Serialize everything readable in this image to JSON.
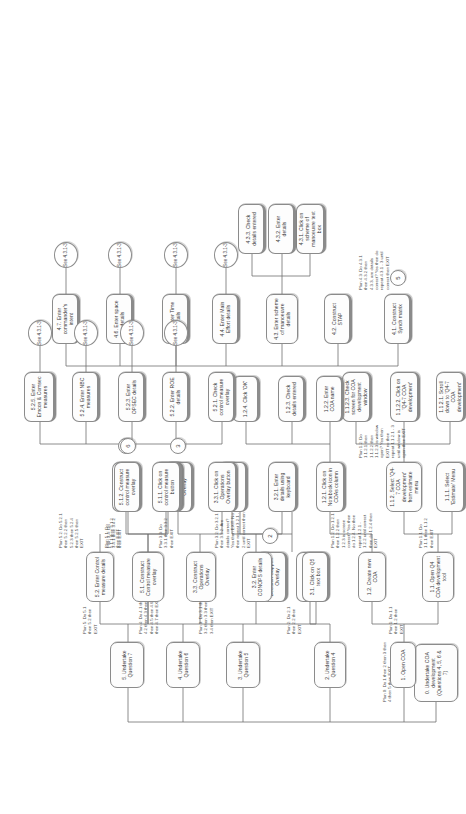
{
  "diagram": {
    "type": "hierarchical-task-analysis",
    "orientation": "rotated-90-ccw",
    "accent": "#8b8b8b",
    "background": "#ffffff"
  },
  "nodes": [
    {
      "id": "n0",
      "label": "0. Undertake COA development (Questions 4, 5, 6 & 7)"
    },
    {
      "id": "n1",
      "label": "1. Open COA"
    },
    {
      "id": "n11",
      "label": "1.1. Open Q4 COA development tool"
    },
    {
      "id": "n111",
      "label": "1.1.1. Select 'Estimate' Menu"
    },
    {
      "id": "n112",
      "label": "1.1.2. Select 'Q4-7 COA development' from estimate menu"
    },
    {
      "id": "n1121",
      "label": "1.1.2.1. Scroll down to 'Q4-7 COA development'"
    },
    {
      "id": "n1122",
      "label": "1.1.2.2. Click on 'Q4-7 COA development'"
    },
    {
      "id": "n1123",
      "label": "1.1.2.3. Check screen for COA development window"
    },
    {
      "id": "n12",
      "label": "1.2. Create new COA"
    },
    {
      "id": "n121",
      "label": "1.2.1. Click on Notebook icon in COAs column"
    },
    {
      "id": "n122",
      "label": "1.2.2. Enter COA name"
    },
    {
      "id": "n123",
      "label": "1.2.3. Check details entered"
    },
    {
      "id": "n124",
      "label": "1.2.4. Click 'OK'"
    },
    {
      "id": "n2",
      "label": "2. Undertake Question 4"
    },
    {
      "id": "n21",
      "label": "2.1. Click on Decision Support Overlay button"
    },
    {
      "id": "n22",
      "label": "2.2. Construct Decision Support Overlay"
    },
    {
      "id": "n3",
      "label": "3. Undertake Question 5"
    },
    {
      "id": "n31",
      "label": "3.1. Click on Q5 text box"
    },
    {
      "id": "n32",
      "label": "3.2. Enter CONOPS details"
    },
    {
      "id": "n321",
      "label": "3.2.1. Enter details using keyboard"
    },
    {
      "id": "n322",
      "label": "3.2.2. Check details entered"
    },
    {
      "id": "n33",
      "label": "3.3. Construct Operations Overlay"
    },
    {
      "id": "n331",
      "label": "3.3.1. Click on Operations Overlay button"
    },
    {
      "id": "n332",
      "label": "3.3.2. Construct Operations Overlay"
    },
    {
      "id": "n34",
      "label": "3.4. Construct TASK ORG"
    },
    {
      "id": "n341",
      "label": "3.4.1. Click on TASK ORG button"
    },
    {
      "id": "n342",
      "label": "3.4.2. Construct TASK ORG"
    },
    {
      "id": "n4",
      "label": "4. Undertake Question 6"
    },
    {
      "id": "n41",
      "label": "4.1. Construct Synch matrix"
    },
    {
      "id": "n42",
      "label": "4.2. Construct STAP"
    },
    {
      "id": "n43",
      "label": "4.3. Enter scheme of manoeuvre details"
    },
    {
      "id": "n431",
      "label": "4.3.1. Click on scheme of manoeuvre text box"
    },
    {
      "id": "n432",
      "label": "4.3.2. Enter details"
    },
    {
      "id": "n433",
      "label": "4.3.3. Check details entered"
    },
    {
      "id": "n44",
      "label": "4.4. Enter Main Effort details"
    },
    {
      "id": "n45",
      "label": "4.5. Enter Time details"
    },
    {
      "id": "n46",
      "label": "4.6. Enter space details"
    },
    {
      "id": "n47",
      "label": "4.7. Enter commander's intent"
    },
    {
      "id": "n5",
      "label": "5. Undertake Question 7"
    },
    {
      "id": "n51",
      "label": "5.1. Construct Control measure overlay"
    },
    {
      "id": "n511",
      "label": "5.1.1. Click on control measure button"
    },
    {
      "id": "n512",
      "label": "5.1.2. Construct control measure overlay"
    },
    {
      "id": "n52",
      "label": "5.2. Enter Control measure details"
    },
    {
      "id": "n521",
      "label": "5.2.1. Check control measure overlay"
    },
    {
      "id": "n522",
      "label": "5.2.2. Enter ROE details"
    },
    {
      "id": "n523",
      "label": "5.2.3. Enter OPSEC details"
    },
    {
      "id": "n524",
      "label": "5.2.4. Enter NBC measures"
    },
    {
      "id": "n525",
      "label": "5.2.5. Enter Emcon & Comsec measures"
    }
  ],
  "connectors": [
    {
      "id": "c2",
      "label": "2"
    },
    {
      "id": "c3",
      "label": "3"
    },
    {
      "id": "c4",
      "label": "4"
    },
    {
      "id": "c5",
      "label": "5"
    },
    {
      "id": "c6",
      "label": "6"
    }
  ],
  "references": [
    {
      "id": "r44",
      "label": "See 4.3.1-3"
    },
    {
      "id": "r45",
      "label": "See 4.3.1-3"
    },
    {
      "id": "r46",
      "label": "See 4.3.1-3"
    },
    {
      "id": "r47",
      "label": "See 4.3.1-3"
    },
    {
      "id": "r522",
      "label": "See 4.3.1-3"
    },
    {
      "id": "r523",
      "label": "See 4.3.1-3"
    },
    {
      "id": "r524",
      "label": "See 4.3.1-3"
    },
    {
      "id": "r525",
      "label": "See 4.3.1-3"
    }
  ],
  "plans": [
    {
      "id": "p0",
      "text": "Plan 0: Do 1 then 2 then 3 then 4 then 5 then EXIT"
    },
    {
      "id": "p1",
      "text": "Plan 1: Do 1.1 then 1.2 then EXIT"
    },
    {
      "id": "p11",
      "text": "Plan 1.1: Do 1.1.1 then 1.1.2 then EXIT"
    },
    {
      "id": "p112",
      "text": "Plan 1.2: Do 1.1.2.1 then 1.1.2.2 then 1.1.2.3 is window open? Yes then EXIT no then repeat 1.1.2.1 - 3 until window is open then EXIT"
    },
    {
      "id": "p12",
      "text": "Plan 1.2: Do 1.2.1 then 1.2.2 then 1.2.3 is screen correct? Yes then do 1.2.4. No then repeat 1.2.1 - 1.2.2 until correct then do 1.2.4 then EXIT"
    },
    {
      "id": "p2",
      "text": "Plan 2: Do 2.1 then 2.2 then EXIT"
    },
    {
      "id": "p3",
      "text": "Plan 3: Do 3.1 then 3.2 then 3.3 then 3.4 then EXIT"
    },
    {
      "id": "p32",
      "text": "Plan 3.2: Do 3.2.1 then 3.2.2. Are details correct? Yes then EXIT. No then repeat 3.2.1 - 2 until correct then EXIT"
    },
    {
      "id": "p33",
      "text": "Plan 3.3: Do 3.3.1 then 3.3.2 then EXIT"
    },
    {
      "id": "p34",
      "text": "Plan 3.4: Do 3.4.1 then 3.4.2 then EXIT"
    },
    {
      "id": "p4",
      "text": "Plan 4: Do 4.1 then 4.2 then 4.3 then 4.4 then 4.5 then 4.6 then 4.7 then EXIT"
    },
    {
      "id": "p43",
      "text": "Plan 4.3: Do 4.3.1 then 4.3.2 then 4.3.3, are details correct? Yes then do repeat 4.3.1 - 3 until correct then EXIT"
    },
    {
      "id": "p5",
      "text": "Plan 5: Do 5.1 then 5.2 then EXIT"
    },
    {
      "id": "p51",
      "text": "Plan 5.1: Do 5.1.1 then 5.1.2 then EXIT"
    },
    {
      "id": "p52",
      "text": "Plan 5.2: Do 5.2.1 then 5.2.2 then 5.2.3 then 5.2.4 then 5.2.5 then EXIT"
    }
  ]
}
